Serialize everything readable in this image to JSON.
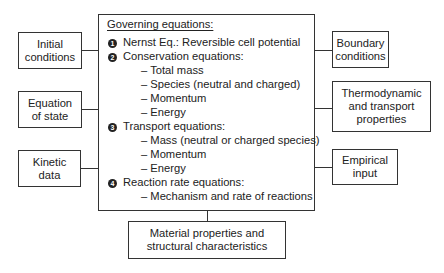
{
  "diagram": {
    "main": {
      "title": "Governing equations:",
      "items": [
        {
          "num": "1",
          "label": "Nernst  Eq.: Reversible cell  potential",
          "subs": []
        },
        {
          "num": "2",
          "label": "Conservation equations:",
          "subs": [
            "– Total mass",
            "– Species (neutral and charged)",
            "– Momentum",
            "– Energy"
          ]
        },
        {
          "num": "3",
          "label": "Transport equations:",
          "subs": [
            "– Mass (neutral or charged species)",
            "– Momentum",
            "– Energy"
          ]
        },
        {
          "num": "4",
          "label": "Reaction rate equations:",
          "subs": [
            "– Mechanism and rate of reactions"
          ]
        }
      ]
    },
    "left_boxes": [
      {
        "label": "Initial\nconditions"
      },
      {
        "label": "Equation\nof state"
      },
      {
        "label": "Kinetic\ndata"
      }
    ],
    "right_boxes": [
      {
        "label": "Boundary\nconditions"
      },
      {
        "label": "Thermodynamic\nand transport\nproperties"
      },
      {
        "label": "Empirical\ninput"
      }
    ],
    "bottom_box": {
      "label": "Material properties and\nstructural characteristics"
    }
  }
}
